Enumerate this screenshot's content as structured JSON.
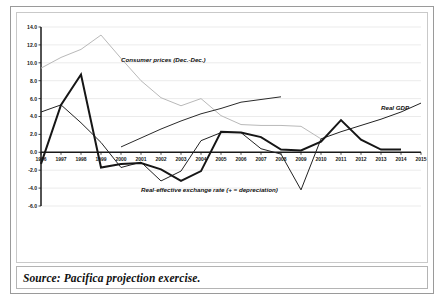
{
  "figure": {
    "source_note": "Source: Pacifica projection exercise."
  },
  "chart_data": {
    "type": "line",
    "title": "",
    "subtitle": "",
    "xlabel": "",
    "ylabel": "",
    "x": [
      1996,
      1997,
      1998,
      1999,
      2000,
      2001,
      2002,
      2003,
      2004,
      2005,
      2006,
      2007,
      2008,
      2009,
      2010,
      2011,
      2012,
      2013,
      2014,
      2015
    ],
    "x_tick_labels": [
      "1996",
      "1997",
      "1998",
      "1999",
      "2000",
      "2001",
      "2002",
      "2003",
      "2004",
      "2005",
      "2006",
      "2007",
      "2008",
      "2009",
      "2010",
      "2011",
      "2012",
      "2013",
      "2014",
      "2015"
    ],
    "y_tick_labels": [
      "14.0",
      "12.0",
      "10.0",
      "8.0",
      "6.0",
      "4.0",
      "2.0",
      "0.0",
      "-2.0",
      "-4.0",
      "-6.0"
    ],
    "y_ticks": [
      14.0,
      12.0,
      10.0,
      8.0,
      6.0,
      4.0,
      2.0,
      0.0,
      -2.0,
      -4.0,
      -6.0
    ],
    "ylim": [
      -6.0,
      14.0
    ],
    "grid": true,
    "legend_position": "inline-annotations",
    "series": [
      {
        "name": "Consumer prices (Dec.-Dec.)",
        "color": "#b9b9b9",
        "width": 1.0,
        "label_x": 2000,
        "label_y": 10.1,
        "values": [
          9.4,
          10.6,
          11.5,
          13.1,
          10.5,
          8.0,
          6.1,
          5.2,
          6.0,
          4.1,
          3.1,
          3.0,
          3.0,
          2.9,
          1.5,
          null,
          null,
          null,
          null,
          null
        ]
      },
      {
        "name": "Real GDP",
        "color": "#222222",
        "width": 1.0,
        "label_x": 2013,
        "label_y": 4.7,
        "values": [
          4.5,
          5.3,
          3.3,
          1.1,
          -1.7,
          -1.1,
          -3.2,
          -2.1,
          1.3,
          2.2,
          2.2,
          0.4,
          -0.2,
          -4.2,
          1.5,
          2.3,
          3.0,
          3.7,
          4.5,
          5.5
        ]
      },
      {
        "name": "Real-effective exchange rate (+ = depreciation)",
        "color": "#161616",
        "width": 2.0,
        "label_x": 2001,
        "label_y": -4.4,
        "values": [
          -1.3,
          5.3,
          8.7,
          -1.7,
          -1.3,
          -1.2,
          -1.9,
          -3.2,
          -2.1,
          2.3,
          2.2,
          1.7,
          0.3,
          0.2,
          1.2,
          3.6,
          1.4,
          0.3,
          0.3,
          null
        ]
      },
      {
        "name": "Real GDP (projection segment)",
        "color": "#2a2a2a",
        "width": 1.0,
        "label_x": null,
        "label_y": null,
        "values": [
          null,
          null,
          null,
          null,
          0.6,
          1.6,
          2.6,
          3.5,
          4.3,
          4.9,
          5.6,
          5.9,
          6.2,
          null,
          null,
          null,
          null,
          null,
          null,
          null
        ]
      }
    ],
    "annotations": [
      {
        "text": "Consumer prices (Dec.-Dec.)",
        "x": 2000,
        "y": 10.1
      },
      {
        "text": "Real GDP",
        "x": 2013,
        "y": 4.7
      },
      {
        "text": "Real-effective exchange rate (+ = depreciation)",
        "x": 2001,
        "y": -4.4
      }
    ]
  }
}
